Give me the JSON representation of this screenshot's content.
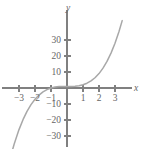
{
  "chart_data": {
    "type": "line",
    "title": "",
    "subtitle": "",
    "xlabel": "x",
    "ylabel": "y",
    "xlim": [
      -3.7,
      3.9
    ],
    "ylim": [
      -38,
      38
    ],
    "grid": false,
    "legend": null,
    "x_ticks": [
      {
        "value": -3,
        "label": "−3"
      },
      {
        "value": -2,
        "label": "−2"
      },
      {
        "value": -1,
        "label": "−1"
      },
      {
        "value": 1,
        "label": "1"
      },
      {
        "value": 2,
        "label": "2"
      },
      {
        "value": 3,
        "label": "3"
      }
    ],
    "y_ticks": [
      {
        "value": 30,
        "label": "30"
      },
      {
        "value": 20,
        "label": "20"
      },
      {
        "value": 10,
        "label": "10"
      },
      {
        "value": -10,
        "label": "−10"
      },
      {
        "value": -20,
        "label": "−20"
      },
      {
        "value": -30,
        "label": "−30"
      }
    ],
    "series": [
      {
        "name": "cubic curve",
        "color": "#a8a8a8",
        "x": [
          -3.55,
          -3.3,
          -3.0,
          -2.75,
          -2.5,
          -2.25,
          -2.0,
          -1.75,
          -1.5,
          -1.25,
          -1.0,
          -0.75,
          -0.5,
          -0.25,
          0.0,
          0.25,
          0.5,
          0.75,
          1.0,
          1.25,
          1.5,
          1.75,
          2.0,
          2.25,
          2.5,
          2.75,
          3.0,
          3.25,
          3.45
        ],
        "y": [
          -43.7,
          -35.0,
          -26.0,
          -19.8,
          -14.6,
          -10.4,
          -7.0,
          -4.4,
          -2.4,
          -1.0,
          0.0,
          0.6,
          0.9,
          1.0,
          1.0,
          1.0,
          1.1,
          1.4,
          2.0,
          3.0,
          4.4,
          6.4,
          9.0,
          12.4,
          16.6,
          21.8,
          28.0,
          35.3,
          42.1
        ]
      }
    ]
  },
  "axis_labels": {
    "x_axis_name": "x",
    "y_axis_name": "y"
  },
  "colors": {
    "background": "#ffffff",
    "axis": "#808080",
    "curve": "#a8a8a8",
    "text": "#666666"
  }
}
